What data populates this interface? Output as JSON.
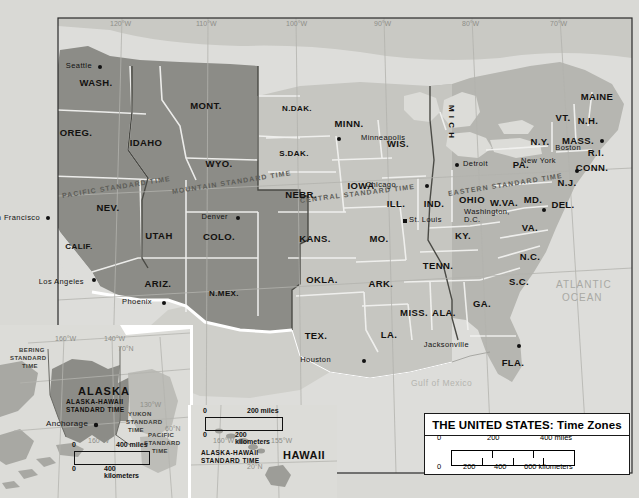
{
  "title_box": {
    "title": "THE UNITED STATES: Time Zones",
    "scale_miles": {
      "zero": "0",
      "mid": "200",
      "end": "400 miles"
    },
    "scale_km": {
      "zero": "0",
      "t1": "200",
      "t2": "400",
      "end": "600 kilometers"
    }
  },
  "graticule": {
    "longitudes": [
      "120°W",
      "110°W",
      "100°W",
      "90°W",
      "80°W",
      "70°W"
    ],
    "latitudes": [
      "40°N"
    ]
  },
  "time_zones": [
    {
      "name": "PACIFIC STANDARD TIME"
    },
    {
      "name": "MOUNTAIN STANDARD TIME"
    },
    {
      "name": "CENTRAL STANDARD TIME"
    },
    {
      "name": "EASTERN STANDARD TIME"
    }
  ],
  "states": [
    {
      "abbr": "WASH.",
      "x": 96,
      "y": 82
    },
    {
      "abbr": "OREG.",
      "x": 76,
      "y": 132
    },
    {
      "abbr": "IDAHO",
      "x": 146,
      "y": 142
    },
    {
      "abbr": "MONT.",
      "x": 206,
      "y": 105
    },
    {
      "abbr": "WYO.",
      "x": 219,
      "y": 163
    },
    {
      "abbr": "NEV.",
      "x": 108,
      "y": 207
    },
    {
      "abbr": "UTAH",
      "x": 159,
      "y": 235
    },
    {
      "abbr": "COLO.",
      "x": 219,
      "y": 236
    },
    {
      "abbr": "CALIF.",
      "x": 79,
      "y": 246
    },
    {
      "abbr": "ARIZ.",
      "x": 158,
      "y": 283
    },
    {
      "abbr": "N.MEX.",
      "x": 224,
      "y": 293
    },
    {
      "abbr": "N.DAK.",
      "x": 297,
      "y": 108
    },
    {
      "abbr": "S.DAK.",
      "x": 294,
      "y": 153
    },
    {
      "abbr": "NEBR.",
      "x": 301,
      "y": 194
    },
    {
      "abbr": "KANS.",
      "x": 315,
      "y": 238
    },
    {
      "abbr": "OKLA.",
      "x": 322,
      "y": 279
    },
    {
      "abbr": "TEX.",
      "x": 316,
      "y": 335
    },
    {
      "abbr": "MINN.",
      "x": 349,
      "y": 123
    },
    {
      "abbr": "IOWA",
      "x": 361,
      "y": 185
    },
    {
      "abbr": "MO.",
      "x": 379,
      "y": 238
    },
    {
      "abbr": "ARK.",
      "x": 381,
      "y": 283
    },
    {
      "abbr": "LA.",
      "x": 389,
      "y": 334
    },
    {
      "abbr": "WIS.",
      "x": 398,
      "y": 143
    },
    {
      "abbr": "ILL.",
      "x": 396,
      "y": 203
    },
    {
      "abbr": "IND.",
      "x": 434,
      "y": 203
    },
    {
      "abbr": "MISS.",
      "x": 414,
      "y": 312
    },
    {
      "abbr": "ALA.",
      "x": 444,
      "y": 312
    },
    {
      "abbr": "TENN.",
      "x": 438,
      "y": 265
    },
    {
      "abbr": "KY.",
      "x": 463,
      "y": 235
    },
    {
      "abbr": "GA.",
      "x": 482,
      "y": 303
    },
    {
      "abbr": "FLA.",
      "x": 513,
      "y": 362
    },
    {
      "abbr": "S.C.",
      "x": 519,
      "y": 281
    },
    {
      "abbr": "N.C.",
      "x": 530,
      "y": 256
    },
    {
      "abbr": "VA.",
      "x": 530,
      "y": 227
    },
    {
      "abbr": "W.VA.",
      "x": 504,
      "y": 202
    },
    {
      "abbr": "OHIO",
      "x": 472,
      "y": 199
    },
    {
      "abbr": "MD.",
      "x": 533,
      "y": 199
    },
    {
      "abbr": "DEL.",
      "x": 563,
      "y": 204
    },
    {
      "abbr": "PA.",
      "x": 521,
      "y": 164
    },
    {
      "abbr": "N.J.",
      "x": 567,
      "y": 182
    },
    {
      "abbr": "N.Y.",
      "x": 540,
      "y": 141
    },
    {
      "abbr": "CONN.",
      "x": 592,
      "y": 167
    },
    {
      "abbr": "R.I.",
      "x": 596,
      "y": 152
    },
    {
      "abbr": "MASS.",
      "x": 578,
      "y": 140
    },
    {
      "abbr": "VT.",
      "x": 563,
      "y": 117
    },
    {
      "abbr": "N.H.",
      "x": 588,
      "y": 120
    },
    {
      "abbr": "MAINE",
      "x": 597,
      "y": 96
    },
    {
      "abbr": "M I C H",
      "x": 451,
      "y": 122
    }
  ],
  "cities": [
    {
      "name": "Seattle",
      "x": 98,
      "y": 65,
      "dx": 92,
      "dy": 65
    },
    {
      "name": "San Francisco",
      "x": 46,
      "y": 216,
      "dx": 40,
      "dy": 217
    },
    {
      "name": "Los Angeles",
      "x": 92,
      "y": 278,
      "dx": 84,
      "dy": 281
    },
    {
      "name": "Phoenix",
      "x": 162,
      "y": 301,
      "dx": 152,
      "dy": 301
    },
    {
      "name": "Denver",
      "x": 236,
      "y": 216,
      "dx": 228,
      "dy": 216
    },
    {
      "name": "Minneapolis",
      "x": 337,
      "y": 137,
      "dx": 361,
      "dy": 137
    },
    {
      "name": "Chicago",
      "x": 425,
      "y": 184,
      "dx": 396,
      "dy": 184
    },
    {
      "name": "Detroit",
      "x": 455,
      "y": 163,
      "dx": 463,
      "dy": 163
    },
    {
      "name": "St. Louis",
      "x": 403,
      "y": 219,
      "dx": 409,
      "dy": 219
    },
    {
      "name": "Houston",
      "x": 362,
      "y": 359,
      "dx": 331,
      "dy": 359
    },
    {
      "name": "Jacksonville",
      "x": 517,
      "y": 344,
      "dx": 469,
      "dy": 344
    },
    {
      "name": "New York",
      "x": 575,
      "y": 169,
      "dx": 556,
      "dy": 160
    },
    {
      "name": "Boston",
      "x": 600,
      "y": 139,
      "dx": 581,
      "dy": 147
    },
    {
      "name": "Washington, D.C.",
      "x": 542,
      "y": 208,
      "dx": 510,
      "dy": 212
    }
  ],
  "water_labels": [
    {
      "name": "ATLANTIC",
      "x": 556,
      "y": 279
    },
    {
      "name": "OCEAN",
      "x": 562,
      "y": 292
    },
    {
      "name": "Gulf of Mexico",
      "x": 411,
      "y": 378
    }
  ],
  "alaska_inset": {
    "title": "ALASKA",
    "subtitle_line1": "ALASKA-HAWAII",
    "subtitle_line2": "STANDARD TIME",
    "city": "Anchorage",
    "zones": [
      {
        "l1": "BERING",
        "l2": "STANDARD",
        "l3": "TIME"
      },
      {
        "l1": "YUKON",
        "l2": "STANDARD",
        "l3": "TIME"
      },
      {
        "l1": "PACIFIC",
        "l2": "STANDARD",
        "l3": "TIME"
      }
    ],
    "grid": [
      "160°W",
      "140°W",
      "70°N",
      "130°W",
      "60°N",
      "160°W"
    ],
    "scale_miles": {
      "zero": "0",
      "end": "400 miles"
    },
    "scale_km": {
      "zero": "0",
      "end": "400 kilometers"
    }
  },
  "hawaii_inset": {
    "title": "HAWAII",
    "subtitle_line1": "ALASKA-HAWAII",
    "subtitle_line2": "STANDARD TIME",
    "grid": [
      "160°W",
      "155°W",
      "20°N"
    ],
    "scale_miles": {
      "zero": "0",
      "end": "200 miles"
    },
    "scale_km": {
      "zero": "0",
      "end": "200 kilometers"
    }
  },
  "colors": {
    "pacific_zone": "#8f8f8a",
    "mountain_zone": "#8f8f8a",
    "central_zone": "#c4c4bf",
    "eastern_zone": "#b5b5b0",
    "ocean": "#dcdcd8",
    "border": "#ffffff",
    "title_bg": "#ffffff",
    "ink": "#111111"
  }
}
